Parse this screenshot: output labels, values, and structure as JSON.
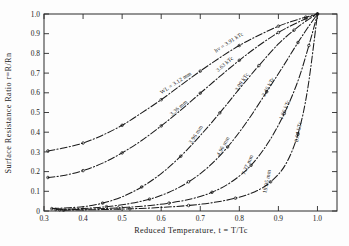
{
  "chart_data": {
    "type": "line",
    "title": "",
    "xlabel": "Reduced Temperature, t = T/Tc",
    "ylabel": "Surface Resistance Ratio  r=R/Rn",
    "xlim": [
      0.3,
      1.05
    ],
    "ylim": [
      0.0,
      1.0
    ],
    "xticks": [
      0.3,
      0.4,
      0.5,
      0.6,
      0.7,
      0.8,
      0.9,
      1.0
    ],
    "xticklabels": [
      "0.3",
      "0.4",
      "0.5",
      "0.6",
      "0.7",
      "0.8",
      "0.9",
      "1.0"
    ],
    "yticks": [
      0.0,
      0.1,
      0.2,
      0.3,
      0.4,
      0.5,
      0.6,
      0.7,
      0.8,
      0.9,
      1.0
    ],
    "yticklabels": [
      "0",
      "0.1",
      "0.2",
      "0.3",
      "0.4",
      "0.5",
      "0.6",
      "0.7",
      "0.8",
      "0.9",
      "1.0"
    ],
    "grid": false,
    "legend_position": "inline-curve-labels",
    "series": [
      {
        "name": "WL = 3.12 mm   hv = 3.91 kTc",
        "label_wavelength": "WL = 3.12 mm",
        "label_energy": "hv = 3.91 kTc",
        "x": [
          0.31,
          0.35,
          0.4,
          0.45,
          0.5,
          0.55,
          0.6,
          0.65,
          0.7,
          0.75,
          0.8,
          0.85,
          0.9,
          0.94,
          0.97,
          1.0
        ],
        "y": [
          0.305,
          0.32,
          0.345,
          0.385,
          0.435,
          0.498,
          0.565,
          0.638,
          0.71,
          0.778,
          0.84,
          0.892,
          0.938,
          0.966,
          0.984,
          1.0
        ]
      },
      {
        "name": "3.36 mm   3.63 kTc",
        "label_wavelength": "3.36 mm",
        "label_energy": "3.63 kTc",
        "x": [
          0.31,
          0.35,
          0.4,
          0.45,
          0.5,
          0.55,
          0.6,
          0.65,
          0.7,
          0.75,
          0.8,
          0.85,
          0.9,
          0.94,
          0.97,
          1.0
        ],
        "y": [
          0.17,
          0.18,
          0.205,
          0.243,
          0.295,
          0.358,
          0.432,
          0.512,
          0.598,
          0.683,
          0.765,
          0.84,
          0.906,
          0.948,
          0.976,
          1.0
        ]
      },
      {
        "name": "3.96 mm   3.09 kTc",
        "label_wavelength": "3.96 mm",
        "label_energy": "3.09 kTc",
        "x": [
          0.32,
          0.4,
          0.45,
          0.5,
          0.55,
          0.6,
          0.65,
          0.7,
          0.75,
          0.8,
          0.85,
          0.9,
          0.94,
          0.97,
          1.0
        ],
        "y": [
          0.012,
          0.022,
          0.04,
          0.072,
          0.122,
          0.19,
          0.278,
          0.383,
          0.498,
          0.62,
          0.738,
          0.848,
          0.918,
          0.963,
          1.0
        ]
      },
      {
        "name": "4.96 mm   2.46 kTc",
        "label_wavelength": "4.96 mm",
        "label_energy": "2.46 kTc",
        "x": [
          0.33,
          0.4,
          0.46,
          0.52,
          0.57,
          0.62,
          0.67,
          0.72,
          0.77,
          0.82,
          0.87,
          0.91,
          0.95,
          0.975,
          1.0
        ],
        "y": [
          0.008,
          0.013,
          0.022,
          0.038,
          0.06,
          0.095,
          0.148,
          0.222,
          0.325,
          0.455,
          0.605,
          0.728,
          0.855,
          0.93,
          1.0
        ]
      },
      {
        "name": "7.37 mm   1.66 kTc",
        "label_wavelength": "7.37 mm",
        "label_energy": "1.66 kTc",
        "x": [
          0.34,
          0.42,
          0.49,
          0.56,
          0.62,
          0.68,
          0.73,
          0.78,
          0.83,
          0.875,
          0.915,
          0.95,
          0.978,
          1.0
        ],
        "y": [
          0.006,
          0.01,
          0.016,
          0.026,
          0.04,
          0.063,
          0.095,
          0.148,
          0.232,
          0.35,
          0.495,
          0.66,
          0.84,
          1.0
        ]
      },
      {
        "name": "19.05 mm   0.64 kTc",
        "label_wavelength": "19.05 mm",
        "label_energy": "0.64 kTc",
        "x": [
          0.35,
          0.44,
          0.52,
          0.6,
          0.67,
          0.73,
          0.79,
          0.84,
          0.88,
          0.918,
          0.95,
          0.975,
          1.0
        ],
        "y": [
          0.004,
          0.007,
          0.011,
          0.018,
          0.028,
          0.042,
          0.065,
          0.098,
          0.148,
          0.235,
          0.39,
          0.62,
          1.0
        ]
      }
    ],
    "curve_labels": [
      {
        "text": "WL = 3.12 mm",
        "angle": -34
      },
      {
        "text": "hv = 3.91 kTc",
        "angle": -34
      },
      {
        "text": "3.36 mm",
        "angle": -42
      },
      {
        "text": "3.63 kTc",
        "angle": -42
      },
      {
        "text": "3.96 mm",
        "angle": -58
      },
      {
        "text": "3.09 kTc",
        "angle": -58
      },
      {
        "text": "4.96 mm",
        "angle": -62
      },
      {
        "text": "2.46 kTc",
        "angle": -62
      },
      {
        "text": "7.37 mm",
        "angle": -68
      },
      {
        "text": "1.66 kTc",
        "angle": -68
      },
      {
        "text": "19.05 mm",
        "angle": -80
      },
      {
        "text": "0.64 kTc",
        "angle": -80
      }
    ]
  }
}
